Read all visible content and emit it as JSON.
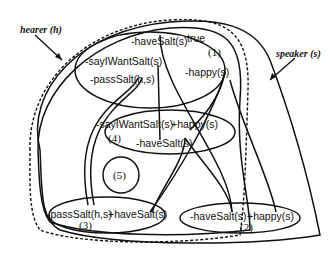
{
  "diagram": {
    "agents": {
      "hearer": "hearer (h)",
      "speaker": "speaker (s)"
    },
    "states": [
      {
        "id": "1",
        "label": "(1)",
        "props": [
          "-haveSalt(s)",
          "true",
          "-sayIWantSalt(s)",
          "-passSalt(h,s)",
          "-happy(s)"
        ]
      },
      {
        "id": "2",
        "label": "(2)",
        "props": [
          "-haveSalt(s)",
          "+happy(s)"
        ]
      },
      {
        "id": "3",
        "label": "(3)",
        "props": [
          "-passSalt(h,s)",
          "+haveSalt(s)"
        ]
      },
      {
        "id": "4",
        "label": "(4)",
        "props": [
          "-sayIWantSalt(s)",
          "+happy(s)",
          "-haveSalt(s)"
        ]
      },
      {
        "id": "5",
        "label": "(5)",
        "props": []
      }
    ]
  }
}
